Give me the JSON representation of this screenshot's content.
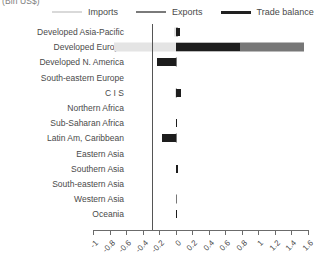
{
  "axis_unit_caption": "(Bln US$)",
  "legend": {
    "position": "top",
    "items": [
      {
        "label": "Imports",
        "key": "imports",
        "color": "#d9d9d9",
        "icon": "line-swatch-icon"
      },
      {
        "label": "Exports",
        "key": "exports",
        "color": "#7a7a7a",
        "icon": "line-swatch-icon"
      },
      {
        "label": "Trade balance",
        "key": "balance",
        "color": "#212121",
        "icon": "line-swatch-icon"
      }
    ]
  },
  "chart_data": {
    "type": "bar",
    "orientation": "horizontal",
    "title": "",
    "subtitle": "",
    "xlabel": "(Bln US$)",
    "ylabel": "",
    "xlim": [
      -1.0,
      1.6
    ],
    "xticks": [
      -1,
      -0.8,
      -0.6,
      -0.4,
      -0.2,
      0,
      0.2,
      0.4,
      0.6,
      0.8,
      1,
      1.2,
      1.4,
      1.6
    ],
    "xtick_labels": [
      "-1",
      "-0.8",
      "-0.6",
      "-0.4",
      "-0.2",
      "0",
      "0.2",
      "0.4",
      "0.6",
      "0.8",
      "1",
      "1.2",
      "1.4",
      "1.6"
    ],
    "grid": false,
    "zero_line": true,
    "legend_position": "top",
    "categories": [
      "Developed Asia-Pacific",
      "Developed Europe",
      "Developed N. America",
      "South-eastern Europe",
      "C I S",
      "Northern Africa",
      "Sub-Saharan Africa",
      "Latin Am, Caribbean",
      "Eastern Asia",
      "Southern Asia",
      "South-eastern Asia",
      "Western Asia",
      "Oceania"
    ],
    "series": [
      {
        "name": "Imports",
        "color": "#e4e4e4",
        "values": [
          -0.02,
          -0.75,
          -0.01,
          0.0,
          -0.01,
          0.0,
          0.0,
          -0.01,
          0.0,
          0.0,
          0.0,
          0.0,
          0.0
        ]
      },
      {
        "name": "Exports",
        "color": "#777777",
        "values": [
          0.03,
          1.55,
          0.01,
          0.0,
          0.02,
          0.0,
          0.0,
          0.01,
          0.0,
          0.0,
          0.0,
          0.01,
          0.0
        ]
      },
      {
        "name": "Trade balance",
        "color": "#1d1d1d",
        "values": [
          0.05,
          0.78,
          -0.23,
          0.0,
          0.07,
          0.0,
          0.02,
          -0.16,
          0.0,
          0.03,
          0.0,
          0.0,
          0.02
        ]
      }
    ]
  }
}
